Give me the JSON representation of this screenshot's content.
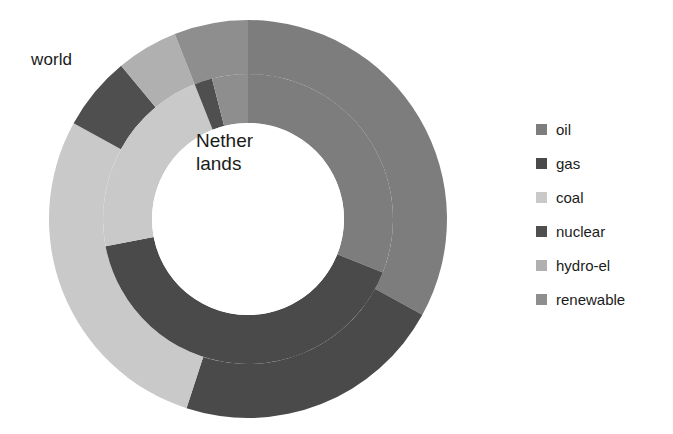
{
  "chart_data": {
    "type": "pie",
    "variant": "nested-donut",
    "title": "",
    "center_label": "Nether\nlands",
    "outer_ring_label": "world",
    "legend_position": "right",
    "legend": [
      "oil",
      "gas",
      "coal",
      "nuclear",
      "hydro-el",
      "renewable"
    ],
    "colors": {
      "oil": "#7d7d7d",
      "gas": "#4a4a4a",
      "coal": "#c9c9c9",
      "nuclear": "#4f4f4f",
      "hydro-el": "#b0b0b0",
      "renewable": "#8e8e8e",
      "background": "#ffffff",
      "text": "#1b1b1b"
    },
    "geometry": {
      "center_x": 248,
      "center_y": 219,
      "outer_radius": 199,
      "mid_radius": 145,
      "hole_radius": 96,
      "start_angle_deg": 0,
      "direction": "clockwise"
    },
    "series": [
      {
        "name": "world",
        "ring": "outer",
        "categories": [
          "oil",
          "gas",
          "coal",
          "nuclear",
          "hydro-el",
          "renewable"
        ],
        "values": [
          33,
          22,
          28,
          6,
          5,
          6
        ]
      },
      {
        "name": "Netherlands",
        "ring": "inner",
        "categories": [
          "oil",
          "gas",
          "coal",
          "nuclear",
          "hydro-el",
          "renewable"
        ],
        "values": [
          31,
          41,
          22,
          2,
          0,
          4
        ]
      }
    ]
  },
  "legend": {
    "items": [
      {
        "label": "oil",
        "color": "#7d7d7d"
      },
      {
        "label": "gas",
        "color": "#4a4a4a"
      },
      {
        "label": "coal",
        "color": "#c9c9c9"
      },
      {
        "label": "nuclear",
        "color": "#4f4f4f"
      },
      {
        "label": "hydro-el",
        "color": "#b0b0b0"
      },
      {
        "label": "renewable",
        "color": "#8e8e8e"
      }
    ]
  },
  "labels": {
    "outer_ring": "world",
    "center": "Nether\nlands"
  }
}
